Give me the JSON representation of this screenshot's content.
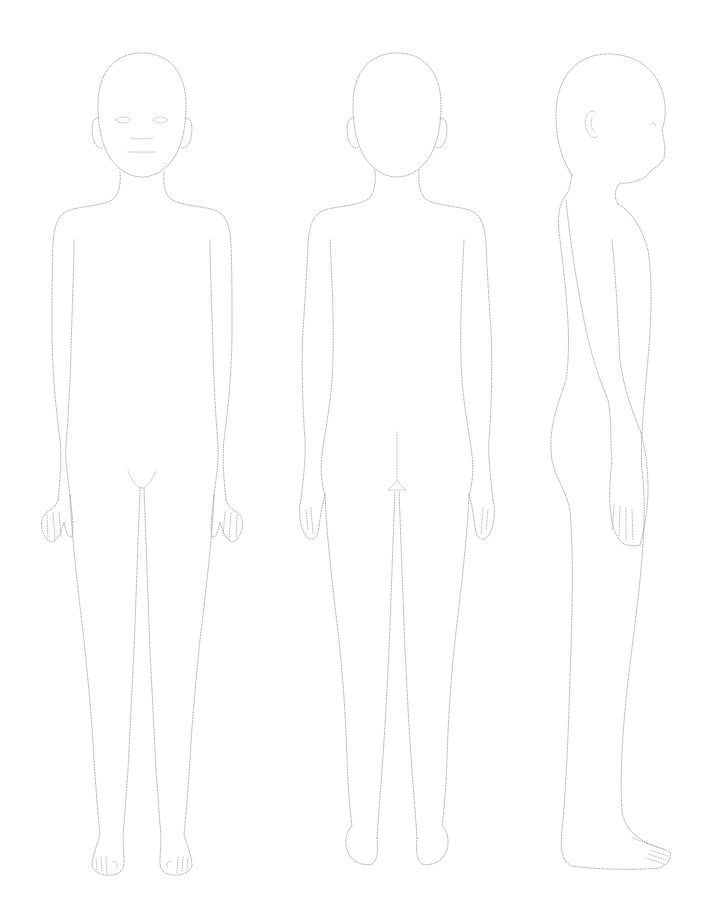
{
  "figure": {
    "type": "croquis-template",
    "views": [
      {
        "id": "front",
        "label": "Front view"
      },
      {
        "id": "back",
        "label": "Back view"
      },
      {
        "id": "side",
        "label": "Side view"
      }
    ],
    "style": {
      "line": "dotted",
      "stroke_color": "#a8a8a8",
      "background": "#ffffff"
    }
  }
}
